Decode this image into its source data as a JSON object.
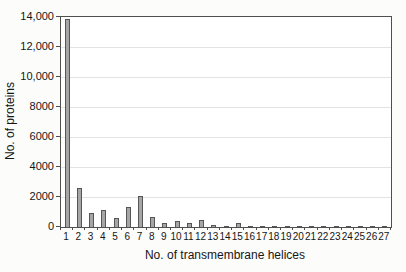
{
  "figure": {
    "background_color": "#fcfcfb",
    "plot_background_color": "#ffffff",
    "frame_color": "#4f4f4f",
    "gridline_color": "#e3e3e2",
    "bar_fill_color": "#a6a6a6",
    "bar_border_color": "#565656"
  },
  "chart_data": {
    "type": "bar",
    "title": "",
    "xlabel": "No. of transmembrane helices",
    "ylabel": "No. of proteins",
    "categories": [
      "1",
      "2",
      "3",
      "4",
      "5",
      "6",
      "7",
      "8",
      "9",
      "10",
      "11",
      "12",
      "13",
      "14",
      "15",
      "16",
      "17",
      "18",
      "19",
      "20",
      "21",
      "22",
      "23",
      "24",
      "25",
      "26",
      "27"
    ],
    "values": [
      13900,
      2600,
      950,
      1150,
      600,
      1350,
      2050,
      650,
      250,
      400,
      300,
      450,
      150,
      100,
      280,
      60,
      35,
      25,
      15,
      12,
      10,
      8,
      40,
      15,
      8,
      20,
      10
    ],
    "ylim": [
      0,
      14000
    ],
    "ytick_interval": 2000,
    "ytick_labels": [
      "0",
      "2000",
      "4000",
      "6000",
      "8000",
      "10,000",
      "12,000",
      "14,000"
    ],
    "grid": "horizontal",
    "legend_position": "none"
  }
}
